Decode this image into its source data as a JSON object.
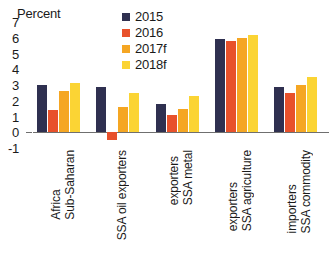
{
  "chart_data": {
    "type": "bar",
    "title": "",
    "subtitle": "",
    "xlabel": "",
    "ylabel": "Percent",
    "ylim": [
      -1,
      7
    ],
    "yticks": [
      7,
      6,
      5,
      4,
      3,
      2,
      1,
      0,
      -1
    ],
    "grid": false,
    "legend_position": "top-right",
    "categories": [
      "Sub-Saharan Africa",
      "SSA oil exporters",
      "SSA metal exporters",
      "SSA agriculture exporters",
      "SSA commodity importers"
    ],
    "category_lines": [
      [
        "Sub-Saharan",
        "Africa"
      ],
      [
        "SSA oil exporters"
      ],
      [
        "SSA metal",
        "exporters"
      ],
      [
        "SSA agriculture",
        "exporters"
      ],
      [
        "SSA commodity",
        "importers"
      ]
    ],
    "series": [
      {
        "name": "2015",
        "color": "#2f3050",
        "values": [
          3.0,
          2.9,
          1.8,
          5.9,
          2.9
        ]
      },
      {
        "name": "2016",
        "color": "#e8512b",
        "values": [
          1.4,
          -0.5,
          1.1,
          5.8,
          2.5
        ]
      },
      {
        "name": "2017f",
        "color": "#f5a623",
        "values": [
          2.6,
          1.6,
          1.5,
          6.0,
          3.0
        ]
      },
      {
        "name": "2018f",
        "color": "#fbd434",
        "values": [
          3.1,
          2.5,
          2.3,
          6.2,
          3.5
        ]
      }
    ]
  }
}
